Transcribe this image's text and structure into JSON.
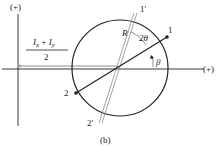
{
  "figure": {
    "caption": "(b)",
    "axes": {
      "vertical_label": "(+)",
      "horizontal_label": "(+)"
    },
    "center_label": {
      "numerator": "I_x + I_y",
      "numerator_parts": {
        "a": "I",
        "a_sub": "x",
        "op": "+",
        "b": "I",
        "b_sub": "y"
      },
      "denominator": "2"
    },
    "radius_label": "R",
    "angle_2theta": "2θ",
    "angle_beta": "β",
    "points": {
      "p1": "1",
      "p2": "2",
      "p1_prime": "1′",
      "p2_prime": "2′"
    },
    "colors": {
      "line": "#222222",
      "gray_line": "#8a8a8a",
      "background": "#ffffff"
    }
  }
}
